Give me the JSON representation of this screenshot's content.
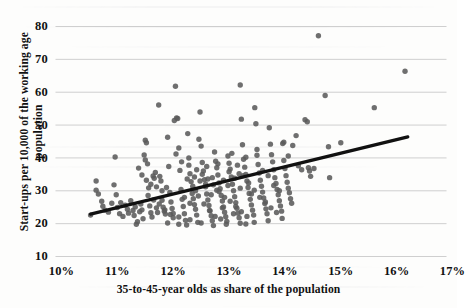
{
  "chart_data": {
    "type": "scatter",
    "title": "",
    "xlabel": "35-to-45-year olds as share of the population",
    "ylabel_line1": "Start-ups per 10,000 of the working age",
    "ylabel_line2": "population",
    "xlim": [
      10,
      17
    ],
    "ylim": [
      10,
      80
    ],
    "xticks": [
      "10%",
      "11%",
      "12%",
      "13%",
      "14%",
      "15%",
      "16%",
      "17%"
    ],
    "xtick_values": [
      10,
      11,
      12,
      13,
      14,
      15,
      16,
      17
    ],
    "yticks": [
      "10",
      "20",
      "30",
      "40",
      "50",
      "60",
      "70",
      "80"
    ],
    "ytick_values": [
      10,
      20,
      30,
      40,
      50,
      60,
      70,
      80
    ],
    "grid": "horizontal",
    "legend": "none",
    "marker_color": "#5b5b5b",
    "marker_size": 5.4,
    "trendline": {
      "type": "linear",
      "color": "#111111",
      "width": 3.2,
      "x_start": 10.52,
      "y_start": 22.9,
      "x_end": 16.2,
      "y_end": 46.4
    },
    "points": [
      [
        10.52,
        22.6
      ],
      [
        10.62,
        33.0
      ],
      [
        10.62,
        30.2
      ],
      [
        10.66,
        29.0
      ],
      [
        10.72,
        26.8
      ],
      [
        10.74,
        25.3
      ],
      [
        10.78,
        24.1
      ],
      [
        10.84,
        23.5
      ],
      [
        10.9,
        26.2
      ],
      [
        10.94,
        31.8
      ],
      [
        10.96,
        40.3
      ],
      [
        10.98,
        28.8
      ],
      [
        11.0,
        24.9
      ],
      [
        11.04,
        23.0
      ],
      [
        11.06,
        26.4
      ],
      [
        11.1,
        22.2
      ],
      [
        11.14,
        25.6
      ],
      [
        11.18,
        24.4
      ],
      [
        11.2,
        23.2
      ],
      [
        11.24,
        27.0
      ],
      [
        11.28,
        24.0
      ],
      [
        11.3,
        22.5
      ],
      [
        11.32,
        25.1
      ],
      [
        11.34,
        19.8
      ],
      [
        11.36,
        20.6
      ],
      [
        11.38,
        36.9
      ],
      [
        11.4,
        23.6
      ],
      [
        11.42,
        26.0
      ],
      [
        11.44,
        24.2
      ],
      [
        11.46,
        21.5
      ],
      [
        11.48,
        40.9
      ],
      [
        11.5,
        39.4
      ],
      [
        11.5,
        45.4
      ],
      [
        11.52,
        44.6
      ],
      [
        11.54,
        38.2
      ],
      [
        11.56,
        30.9
      ],
      [
        11.58,
        25.4
      ],
      [
        11.6,
        23.3
      ],
      [
        11.62,
        22.0
      ],
      [
        11.64,
        34.5
      ],
      [
        11.66,
        33.8
      ],
      [
        11.68,
        35.6
      ],
      [
        11.7,
        24.8
      ],
      [
        11.72,
        23.4
      ],
      [
        11.74,
        56.1
      ],
      [
        11.76,
        34.4
      ],
      [
        11.78,
        33.0
      ],
      [
        11.8,
        27.1
      ],
      [
        11.82,
        25.0
      ],
      [
        11.84,
        23.8
      ],
      [
        11.86,
        22.9
      ],
      [
        11.88,
        31.0
      ],
      [
        11.9,
        46.3
      ],
      [
        11.92,
        37.4
      ],
      [
        11.94,
        29.5
      ],
      [
        11.96,
        26.6
      ],
      [
        11.98,
        24.6
      ],
      [
        12.0,
        23.1
      ],
      [
        12.02,
        51.4
      ],
      [
        12.04,
        61.8
      ],
      [
        12.06,
        52.2
      ],
      [
        12.08,
        52.0
      ],
      [
        12.1,
        43.0
      ],
      [
        12.12,
        36.2
      ],
      [
        12.14,
        30.4
      ],
      [
        12.16,
        27.4
      ],
      [
        12.18,
        25.2
      ],
      [
        12.2,
        23.0
      ],
      [
        12.22,
        21.0
      ],
      [
        12.24,
        19.6
      ],
      [
        12.26,
        47.4
      ],
      [
        12.28,
        40.0
      ],
      [
        12.3,
        35.2
      ],
      [
        12.32,
        32.8
      ],
      [
        12.34,
        29.2
      ],
      [
        12.36,
        27.6
      ],
      [
        12.38,
        25.8
      ],
      [
        12.4,
        24.4
      ],
      [
        12.42,
        22.6
      ],
      [
        12.44,
        20.4
      ],
      [
        12.46,
        45.7
      ],
      [
        12.48,
        54.0
      ],
      [
        12.5,
        43.6
      ],
      [
        12.52,
        38.6
      ],
      [
        12.54,
        36.0
      ],
      [
        12.56,
        33.4
      ],
      [
        12.58,
        31.2
      ],
      [
        12.6,
        29.0
      ],
      [
        12.62,
        27.2
      ],
      [
        12.64,
        25.5
      ],
      [
        12.66,
        23.9
      ],
      [
        12.68,
        22.4
      ],
      [
        12.7,
        20.9
      ],
      [
        12.72,
        19.4
      ],
      [
        12.74,
        41.8
      ],
      [
        12.76,
        39.0
      ],
      [
        12.78,
        37.0
      ],
      [
        12.8,
        34.8
      ],
      [
        12.82,
        32.4
      ],
      [
        12.84,
        30.6
      ],
      [
        12.86,
        28.6
      ],
      [
        12.88,
        26.9
      ],
      [
        12.9,
        25.1
      ],
      [
        12.92,
        23.5
      ],
      [
        12.94,
        22.1
      ],
      [
        12.96,
        20.7
      ],
      [
        12.98,
        40.6
      ],
      [
        13.0,
        38.4
      ],
      [
        13.02,
        36.6
      ],
      [
        13.04,
        34.2
      ],
      [
        13.06,
        32.0
      ],
      [
        13.08,
        30.0
      ],
      [
        13.1,
        28.2
      ],
      [
        13.12,
        26.4
      ],
      [
        13.14,
        24.7
      ],
      [
        13.16,
        23.2
      ],
      [
        13.18,
        21.8
      ],
      [
        13.2,
        20.1
      ],
      [
        13.2,
        62.2
      ],
      [
        13.22,
        51.8
      ],
      [
        13.24,
        44.0
      ],
      [
        13.26,
        39.6
      ],
      [
        13.28,
        37.2
      ],
      [
        13.3,
        35.0
      ],
      [
        13.32,
        33.0
      ],
      [
        13.34,
        31.0
      ],
      [
        13.36,
        29.2
      ],
      [
        13.38,
        27.4
      ],
      [
        13.4,
        25.7
      ],
      [
        13.42,
        24.1
      ],
      [
        13.44,
        22.6
      ],
      [
        13.46,
        55.3
      ],
      [
        13.48,
        50.4
      ],
      [
        13.5,
        42.6
      ],
      [
        13.52,
        38.0
      ],
      [
        13.54,
        35.4
      ],
      [
        13.56,
        33.2
      ],
      [
        13.58,
        31.4
      ],
      [
        13.6,
        29.6
      ],
      [
        13.62,
        27.8
      ],
      [
        13.64,
        26.1
      ],
      [
        13.66,
        24.5
      ],
      [
        13.68,
        23.0
      ],
      [
        13.7,
        20.9
      ],
      [
        13.72,
        49.2
      ],
      [
        13.74,
        44.2
      ],
      [
        13.76,
        41.0
      ],
      [
        13.78,
        38.8
      ],
      [
        13.8,
        36.4
      ],
      [
        13.82,
        34.0
      ],
      [
        13.84,
        32.2
      ],
      [
        13.86,
        30.4
      ],
      [
        13.88,
        28.8
      ],
      [
        13.9,
        27.0
      ],
      [
        13.92,
        25.4
      ],
      [
        13.94,
        23.8
      ],
      [
        13.96,
        44.4
      ],
      [
        13.98,
        39.2
      ],
      [
        14.0,
        36.8
      ],
      [
        14.02,
        34.6
      ],
      [
        14.04,
        32.6
      ],
      [
        14.06,
        30.8
      ],
      [
        14.08,
        29.4
      ],
      [
        14.1,
        27.6
      ],
      [
        14.12,
        26.2
      ],
      [
        14.2,
        46.8
      ],
      [
        14.24,
        37.6
      ],
      [
        14.3,
        36.4
      ],
      [
        14.36,
        51.6
      ],
      [
        14.4,
        51.0
      ],
      [
        14.42,
        37.0
      ],
      [
        14.46,
        34.4
      ],
      [
        14.6,
        77.2
      ],
      [
        14.72,
        59.0
      ],
      [
        14.78,
        43.4
      ],
      [
        14.8,
        34.0
      ],
      [
        15.0,
        44.6
      ],
      [
        15.6,
        55.3
      ],
      [
        16.15,
        66.4
      ],
      [
        12.05,
        41.2
      ],
      [
        12.15,
        38.8
      ],
      [
        12.25,
        33.6
      ],
      [
        12.35,
        31.4
      ],
      [
        12.45,
        28.4
      ],
      [
        12.55,
        26.0
      ],
      [
        12.65,
        24.0
      ],
      [
        12.75,
        22.2
      ],
      [
        12.85,
        21.4
      ],
      [
        12.95,
        19.8
      ],
      [
        13.05,
        41.4
      ],
      [
        13.15,
        37.8
      ],
      [
        13.25,
        34.6
      ],
      [
        13.35,
        32.4
      ],
      [
        13.45,
        30.2
      ],
      [
        13.55,
        28.0
      ],
      [
        13.65,
        26.6
      ],
      [
        13.75,
        24.8
      ],
      [
        13.85,
        23.4
      ],
      [
        13.95,
        21.6
      ],
      [
        11.55,
        28.6
      ],
      [
        11.65,
        27.2
      ],
      [
        11.75,
        26.0
      ],
      [
        11.85,
        24.2
      ],
      [
        11.95,
        22.8
      ],
      [
        12.1,
        22.0
      ],
      [
        12.3,
        21.2
      ],
      [
        12.5,
        20.2
      ],
      [
        12.7,
        34.0
      ],
      [
        12.9,
        33.2
      ],
      [
        13.1,
        33.8
      ],
      [
        13.3,
        40.2
      ],
      [
        13.5,
        40.8
      ],
      [
        13.7,
        34.6
      ],
      [
        13.9,
        30.0
      ],
      [
        12.42,
        36.4
      ],
      [
        12.52,
        35.0
      ],
      [
        12.62,
        33.6
      ],
      [
        12.72,
        31.8
      ],
      [
        12.82,
        29.8
      ],
      [
        12.92,
        28.0
      ],
      [
        13.02,
        26.8
      ],
      [
        13.12,
        25.2
      ],
      [
        13.22,
        23.6
      ],
      [
        13.32,
        22.2
      ],
      [
        12.2,
        28.0
      ],
      [
        12.3,
        26.2
      ],
      [
        12.4,
        30.0
      ],
      [
        12.6,
        37.4
      ],
      [
        12.8,
        38.2
      ],
      [
        13.0,
        35.8
      ],
      [
        13.2,
        30.8
      ],
      [
        13.4,
        29.0
      ],
      [
        13.6,
        36.2
      ],
      [
        13.8,
        31.6
      ],
      [
        11.9,
        20.2
      ],
      [
        12.0,
        21.8
      ],
      [
        12.1,
        19.8
      ],
      [
        13.3,
        19.9
      ],
      [
        13.45,
        20.4
      ],
      [
        12.38,
        34.2
      ],
      [
        12.58,
        32.0
      ],
      [
        12.78,
        30.2
      ],
      [
        12.98,
        31.6
      ],
      [
        13.18,
        35.2
      ],
      [
        12.28,
        37.8
      ],
      [
        12.48,
        33.0
      ],
      [
        12.68,
        28.8
      ],
      [
        12.88,
        24.8
      ],
      [
        13.08,
        23.0
      ],
      [
        11.44,
        34.8
      ],
      [
        11.52,
        33.2
      ],
      [
        11.6,
        32.0
      ],
      [
        11.7,
        31.2
      ],
      [
        11.8,
        30.0
      ],
      [
        14.52,
        36.8
      ],
      [
        14.44,
        36.0
      ],
      [
        14.06,
        40.6
      ],
      [
        14.14,
        43.8
      ],
      [
        13.98,
        44.8
      ]
    ]
  }
}
